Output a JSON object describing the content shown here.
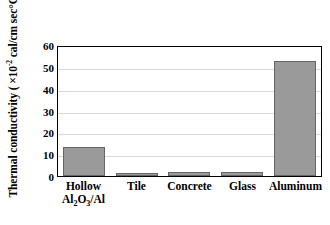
{
  "chart_data": {
    "type": "bar",
    "title": "",
    "xlabel": "",
    "ylabel": "Thermal conductivity ( ×10-2 cal/cm sec°C)",
    "ylabel_parts": {
      "prefix": "Thermal conductivity ( ×10",
      "exponent": "-2",
      "suffix": " cal/cm sec°C)"
    },
    "categories": [
      "Hollow Al2O3/Al",
      "Tile",
      "Concrete",
      "Glass",
      "Aluminum"
    ],
    "category_labels": [
      {
        "line1": "Hollow",
        "line2_pre": "Al",
        "line2_sub1": "2",
        "line2_mid": "O",
        "line2_sub2": "3",
        "line2_post": "/Al"
      },
      {
        "line1": "Tile",
        "line2_pre": "",
        "line2_sub1": "",
        "line2_mid": "",
        "line2_sub2": "",
        "line2_post": ""
      },
      {
        "line1": "Concrete",
        "line2_pre": "",
        "line2_sub1": "",
        "line2_mid": "",
        "line2_sub2": "",
        "line2_post": ""
      },
      {
        "line1": "Glass",
        "line2_pre": "",
        "line2_sub1": "",
        "line2_mid": "",
        "line2_sub2": "",
        "line2_post": ""
      },
      {
        "line1": "Aluminum",
        "line2_pre": "",
        "line2_sub1": "",
        "line2_mid": "",
        "line2_sub2": "",
        "line2_post": ""
      }
    ],
    "values": [
      13.5,
      1.5,
      2.0,
      2.0,
      52.5
    ],
    "ylim": [
      0,
      60
    ],
    "yticks": [
      60,
      50,
      40,
      30,
      20,
      10,
      0
    ],
    "ytick_labels": [
      "60",
      "50",
      "40",
      "30",
      "20",
      "10",
      "0"
    ],
    "grid": "horizontal",
    "legend": "none",
    "colors": {
      "bar_fill": "#9a9a9a",
      "bar_stroke": "#666666",
      "gridline": "#d9d9d9",
      "axis": "#000000",
      "background": "#ffffff",
      "text": "#000000"
    }
  }
}
